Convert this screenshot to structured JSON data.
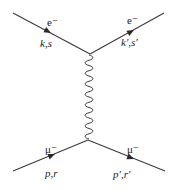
{
  "diagram": {
    "type": "feynman",
    "particles": {
      "electron_in": {
        "name": "e⁻",
        "momentum_label": "k,s"
      },
      "electron_out": {
        "name": "e⁻",
        "momentum_label": "k′,s′"
      },
      "muon_in": {
        "name": "μ⁻",
        "momentum_label": "p,r"
      },
      "muon_out": {
        "name": "μ⁻",
        "momentum_label": "p′,r′"
      }
    },
    "propagator": {
      "name": "photon",
      "style": "wavy"
    },
    "colors": {
      "line": "#3a3a3a",
      "background": "#ffffff"
    }
  }
}
